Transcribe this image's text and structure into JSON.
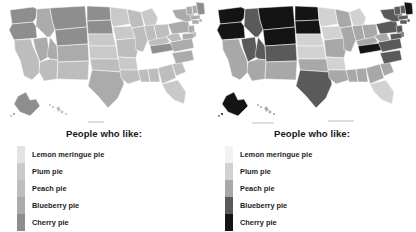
{
  "figure": {
    "panels": [
      {
        "id": "left",
        "legend_title": "People who like:",
        "contrast": "low",
        "ramp": [
          "#e3e3e3",
          "#c9c9c9",
          "#bdbdbd",
          "#ababab",
          "#8e8e8e"
        ],
        "categories": [
          "Lemon meringue pie",
          "Plum pie",
          "Peach pie",
          "Blueberry pie",
          "Cherry pie"
        ]
      },
      {
        "id": "right",
        "legend_title": "People who like:",
        "contrast": "high",
        "ramp": [
          "#f2f2f2",
          "#d2d2d2",
          "#a8a8a8",
          "#5a5a5a",
          "#141414"
        ],
        "categories": [
          "Lemon meringue pie",
          "Plum pie",
          "Peach pie",
          "Blueberry pie",
          "Cherry pie"
        ]
      }
    ]
  },
  "chart_data": {
    "type": "heatmap",
    "title": "",
    "subtitle": "",
    "xlabel": "",
    "ylabel": "",
    "legend_position": "below-map",
    "grid": false,
    "legend_entries": [
      "Lemon meringue pie",
      "Plum pie",
      "Peach pie",
      "Blueberry pie",
      "Cherry pie"
    ],
    "class_count": 5,
    "low_contrast_ramp": [
      "#e3e3e3",
      "#c9c9c9",
      "#bdbdbd",
      "#ababab",
      "#8e8e8e"
    ],
    "high_contrast_ramp": [
      "#f2f2f2",
      "#d2d2d2",
      "#a8a8a8",
      "#5a5a5a",
      "#141414"
    ],
    "categories": [
      "WA",
      "OR",
      "CA",
      "NV",
      "ID",
      "MT",
      "WY",
      "UT",
      "AZ",
      "CO",
      "NM",
      "ND",
      "SD",
      "NE",
      "KS",
      "OK",
      "TX",
      "MN",
      "IA",
      "MO",
      "AR",
      "LA",
      "WI",
      "IL",
      "MS",
      "AL",
      "MI",
      "IN",
      "KY",
      "TN",
      "OH",
      "GA",
      "FL",
      "SC",
      "NC",
      "VA",
      "WV",
      "PA",
      "NY",
      "VT",
      "NH",
      "ME",
      "MA",
      "RI",
      "CT",
      "NJ",
      "DE",
      "MD",
      "AK",
      "HI"
    ],
    "values": [
      5,
      5,
      3,
      4,
      4,
      5,
      5,
      4,
      3,
      4,
      3,
      5,
      5,
      2,
      2,
      3,
      4,
      2,
      2,
      3,
      2,
      3,
      3,
      3,
      3,
      3,
      2,
      3,
      3,
      5,
      3,
      3,
      2,
      3,
      4,
      4,
      3,
      4,
      4,
      4,
      4,
      5,
      4,
      4,
      4,
      4,
      4,
      4,
      5,
      3
    ],
    "value_labels": [
      "Cherry pie",
      "Cherry pie",
      "Peach pie",
      "Blueberry pie",
      "Blueberry pie",
      "Cherry pie",
      "Cherry pie",
      "Blueberry pie",
      "Peach pie",
      "Blueberry pie",
      "Peach pie",
      "Cherry pie",
      "Cherry pie",
      "Plum pie",
      "Plum pie",
      "Peach pie",
      "Blueberry pie",
      "Plum pie",
      "Plum pie",
      "Peach pie",
      "Plum pie",
      "Peach pie",
      "Peach pie",
      "Peach pie",
      "Peach pie",
      "Peach pie",
      "Plum pie",
      "Peach pie",
      "Peach pie",
      "Cherry pie",
      "Peach pie",
      "Peach pie",
      "Plum pie",
      "Peach pie",
      "Blueberry pie",
      "Blueberry pie",
      "Peach pie",
      "Blueberry pie",
      "Blueberry pie",
      "Blueberry pie",
      "Blueberry pie",
      "Cherry pie",
      "Blueberry pie",
      "Blueberry pie",
      "Blueberry pie",
      "Blueberry pie",
      "Blueberry pie",
      "Blueberry pie",
      "Cherry pie",
      "Peach pie"
    ]
  }
}
